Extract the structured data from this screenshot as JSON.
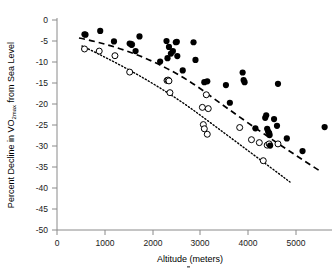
{
  "figure": {
    "background": "#ffffff",
    "ink_color": "#000000",
    "axis_color": "#8a8a8a"
  },
  "chart_data": {
    "type": "scatter",
    "title": "",
    "xlabel": "Altitude (meters)",
    "ylabel": "Percent Decline in VO2max from Sea Level",
    "ylabel_parts": {
      "lead": "Percent Decline in V",
      "o_cap": "O",
      "subscript": "2max",
      "trail": " from Sea Level"
    },
    "xlim": [
      0,
      5600
    ],
    "ylim": [
      -50,
      0
    ],
    "xticks": [
      0,
      1000,
      2000,
      3000,
      4000,
      5000
    ],
    "xtick_labels": [
      "0",
      "1000",
      "2000",
      "3000",
      "4000",
      "5000"
    ],
    "yticks": [
      0,
      -5,
      -10,
      -15,
      -20,
      -25,
      -30,
      -35,
      -40,
      -45,
      -50
    ],
    "ytick_labels": [
      "0",
      "-5",
      "-10",
      "-15",
      "-20",
      "-25",
      "-30",
      "-35",
      "-40",
      "-45",
      "-50"
    ],
    "grid": false,
    "legend": "none",
    "series": [
      {
        "name": "filled-circles",
        "marker": "filled circle",
        "marker_color": "#000000",
        "trendline": "dashed",
        "points": [
          [
            560,
            -3.4
          ],
          [
            580,
            -3.5
          ],
          [
            880,
            -2.6
          ],
          [
            1160,
            -5.1
          ],
          [
            1480,
            -5.6
          ],
          [
            1520,
            -5.9
          ],
          [
            1600,
            -7.4
          ],
          [
            1680,
            -3.9
          ],
          [
            2100,
            -9.9
          ],
          [
            2230,
            -5.0
          ],
          [
            2250,
            -9.1
          ],
          [
            2280,
            -6.4
          ],
          [
            2320,
            -8.0
          ],
          [
            2360,
            -7.4
          ],
          [
            2420,
            -5.3
          ],
          [
            2440,
            -5.2
          ],
          [
            2450,
            -8.6
          ],
          [
            2560,
            -12.0
          ],
          [
            2780,
            -5.3
          ],
          [
            2820,
            -9.5
          ],
          [
            3000,
            -14.8
          ],
          [
            3060,
            -14.6
          ],
          [
            3440,
            -15.5
          ],
          [
            3520,
            -19.7
          ],
          [
            3780,
            -12.5
          ],
          [
            3800,
            -14.3
          ],
          [
            3820,
            -14.8
          ],
          [
            4040,
            -25.8
          ],
          [
            4240,
            -23.3
          ],
          [
            4260,
            -22.7
          ],
          [
            4280,
            -25.9
          ],
          [
            4300,
            -26.6
          ],
          [
            4320,
            -26.9
          ],
          [
            4330,
            -27.4
          ],
          [
            4340,
            -29.9
          ],
          [
            4420,
            -23.6
          ],
          [
            4480,
            -25.2
          ],
          [
            4500,
            -15.2
          ],
          [
            4680,
            -28.2
          ],
          [
            5000,
            -31.2
          ],
          [
            5450,
            -25.5
          ]
        ]
      },
      {
        "name": "open-circles",
        "marker": "open circle",
        "marker_color": "#ffffff",
        "marker_edge": "#000000",
        "trendline": "dotted",
        "points": [
          [
            560,
            -6.9
          ],
          [
            860,
            -7.4
          ],
          [
            1180,
            -8.5
          ],
          [
            1480,
            -12.4
          ],
          [
            1520,
            -5.8
          ],
          [
            2240,
            -14.4
          ],
          [
            2260,
            -14.3
          ],
          [
            2280,
            -14.5
          ],
          [
            2300,
            -17.3
          ],
          [
            2960,
            -20.8
          ],
          [
            2980,
            -24.9
          ],
          [
            3000,
            -25.9
          ],
          [
            3040,
            -17.8
          ],
          [
            3060,
            -27.2
          ],
          [
            3080,
            -21.1
          ],
          [
            3720,
            -25.6
          ],
          [
            3960,
            -28.5
          ],
          [
            4120,
            -29.2
          ],
          [
            4200,
            -33.5
          ],
          [
            4280,
            -29.8
          ],
          [
            4320,
            -29.5
          ],
          [
            4500,
            -29.5
          ]
        ]
      }
    ],
    "annotations": []
  }
}
